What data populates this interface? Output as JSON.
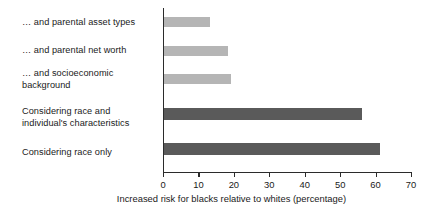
{
  "chart_data": {
    "type": "bar",
    "orientation": "horizontal",
    "title": "",
    "subtitle": "",
    "xlabel": "Increased risk for blacks relative to whites (percentage)",
    "ylabel": "",
    "xlim": [
      0,
      70
    ],
    "xticks": [
      0,
      10,
      20,
      30,
      40,
      50,
      60,
      70
    ],
    "xtick_labels": [
      "0",
      "10",
      "20",
      "30",
      "40",
      "50",
      "60",
      "70"
    ],
    "grid": false,
    "legend": null,
    "categories": [
      "… and parental asset types",
      "… and parental net worth",
      "… and socioeconomic\nbackground",
      "Considering race and\nindividual's characteristics",
      "Considering race only"
    ],
    "values": [
      13,
      18,
      19,
      56,
      61
    ],
    "bar_colors": [
      "#b5b5b5",
      "#b5b5b5",
      "#b5b5b5",
      "#5a5a5a",
      "#5a5a5a"
    ],
    "colors": {
      "light_bar": "#b5b5b5",
      "dark_bar": "#5a5a5a",
      "axis": "#2b2b2b",
      "text": "#1a1a1a",
      "background": "#ffffff"
    },
    "bar_geometry": [
      {
        "top": 9,
        "height": 10
      },
      {
        "top": 38,
        "height": 10
      },
      {
        "top": 66,
        "height": 10
      },
      {
        "top": 100,
        "height": 12
      },
      {
        "top": 135,
        "height": 12
      }
    ],
    "label_tops": [
      17,
      45,
      68,
      110,
      147
    ]
  }
}
